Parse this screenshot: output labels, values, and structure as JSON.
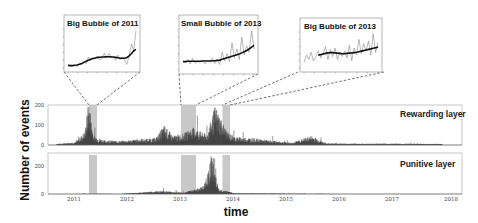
{
  "chart_data": {
    "type": "bar",
    "title": "",
    "xlabel": "time",
    "ylabel": "Number of events",
    "x_ticks": [
      "2011",
      "2012",
      "2013",
      "2014",
      "2015",
      "2016",
      "2017",
      "2018"
    ],
    "xlim": [
      2010.7,
      2018.0
    ],
    "grid": false,
    "legend": "none",
    "highlight_periods": [
      {
        "name": "Big Bubble of 2011",
        "start": 2011.3,
        "end": 2011.45
      },
      {
        "name": "Small Bubble of 2013",
        "start": 2013.0,
        "end": 2013.27
      },
      {
        "name": "Big Bubble of 2013",
        "start": 2013.78,
        "end": 2013.91
      }
    ],
    "panels": [
      {
        "name": "Rewarding layer",
        "ylim": [
          0,
          200
        ],
        "y_ticks": [
          "0",
          "100",
          "200"
        ],
        "series_desc": "daily event counts: ~5-15 in late 2010, spike to ~200 in mid 2011, ~20-40 in 2012, ~30-60 in 2013 with spikes ~170, declining to ~5-15 by 2015-2017",
        "x": [
          2010.85,
          2011.0,
          2011.2,
          2011.35,
          2011.42,
          2011.5,
          2011.7,
          2012.0,
          2012.3,
          2012.6,
          2012.75,
          2012.9,
          2013.1,
          2013.25,
          2013.5,
          2013.65,
          2013.85,
          2014.0,
          2014.3,
          2014.6,
          2015.0,
          2015.35,
          2015.6,
          2016.0,
          2016.5,
          2017.0,
          2017.6
        ],
        "values": [
          5,
          8,
          14,
          60,
          200,
          40,
          20,
          18,
          25,
          30,
          85,
          40,
          50,
          75,
          45,
          170,
          60,
          35,
          30,
          20,
          10,
          40,
          8,
          6,
          6,
          6,
          5
        ]
      },
      {
        "name": "Punitive layer",
        "ylim": [
          0,
          350
        ],
        "y_ticks": [
          "0",
          "200"
        ],
        "series_desc": "near-zero counts with small clusters around late 2012 and a large spike near mid-late 2013",
        "x": [
          2010.85,
          2011.4,
          2012.0,
          2012.7,
          2012.8,
          2013.1,
          2013.45,
          2013.62,
          2013.7,
          2014.0,
          2015.0,
          2016.0,
          2017.0,
          2017.6
        ],
        "values": [
          0,
          2,
          1,
          25,
          20,
          10,
          60,
          340,
          40,
          5,
          2,
          1,
          1,
          0
        ]
      }
    ],
    "insets": [
      {
        "title": "Big Bubble of 2011",
        "y_ticks": [
          "20",
          "40",
          "60",
          "80",
          "100",
          "120",
          "140",
          "160",
          "180",
          "200"
        ],
        "raw": [
          15,
          12,
          10,
          14,
          9,
          20,
          18,
          30,
          25,
          60,
          40,
          55,
          48,
          62,
          45,
          50,
          80,
          52,
          78,
          60,
          55,
          40,
          70,
          45,
          60,
          40,
          20,
          70,
          130,
          95,
          200
        ],
        "smoothed": [
          14,
          13,
          13,
          15,
          16,
          20,
          24,
          30,
          36,
          42,
          47,
          51,
          54,
          57,
          58,
          59,
          60,
          61,
          61,
          60,
          59,
          57,
          55,
          53,
          52,
          53,
          56,
          65,
          78,
          92,
          100
        ]
      },
      {
        "title": "Small Bubble of 2013",
        "raw": [
          30,
          25,
          35,
          20,
          38,
          22,
          30,
          25,
          34,
          20,
          32,
          26,
          40,
          22,
          35,
          18,
          60,
          30,
          55,
          28,
          90,
          40,
          70,
          35,
          110,
          50,
          80,
          60,
          130,
          70
        ],
        "smoothed": [
          28,
          28,
          29,
          29,
          29,
          29,
          29,
          29,
          30,
          30,
          30,
          30,
          31,
          31,
          32,
          33,
          36,
          38,
          41,
          43,
          46,
          48,
          51,
          53,
          57,
          61,
          65,
          70,
          76,
          82
        ]
      },
      {
        "title": "Big Bubble of 2013",
        "raw": [
          20,
          45,
          30,
          55,
          25,
          40,
          60,
          35,
          50,
          75,
          30,
          65,
          40,
          70,
          30,
          55,
          40,
          60,
          35,
          80,
          25,
          70,
          45,
          100,
          50,
          85,
          60,
          95,
          45,
          120,
          55,
          90
        ],
        "smoothed": [
          null,
          null,
          null,
          null,
          null,
          null,
          45,
          47,
          49,
          51,
          53,
          54,
          54,
          53,
          52,
          51,
          50,
          50,
          51,
          52,
          53,
          54,
          55,
          57,
          59,
          61,
          63,
          65,
          67,
          69,
          71,
          73
        ]
      }
    ]
  },
  "labels": {
    "ylabel": "Number of events",
    "xlabel": "time",
    "rewarding": "Rewarding layer",
    "punitive": "Punitive layer",
    "inset1": "Big Bubble of 2011",
    "inset2": "Small Bubble of 2013",
    "inset3": "Big Bubble of 2013",
    "y_top": {
      "t0": "0",
      "t100": "100",
      "t200": "200"
    },
    "y_bot": {
      "t0": "0",
      "t200": "200"
    },
    "years": {
      "y2011": "2011",
      "y2012": "2012",
      "y2013": "2013",
      "y2014": "2014",
      "y2015": "2015",
      "y2016": "2016",
      "y2017": "2017",
      "y2018": "2018"
    }
  },
  "colors": {
    "bars": "#3a3a3a",
    "highlight": "#c8c8c8",
    "frame": "#9a9a9a",
    "raw_line": "#888888",
    "smooth_line": "#111111"
  }
}
